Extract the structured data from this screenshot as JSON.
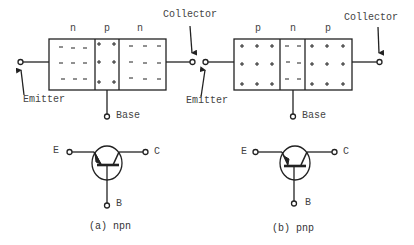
{
  "npn": {
    "regions": [
      "n",
      "p",
      "n"
    ],
    "region_charges": [
      "-",
      "+",
      "-"
    ],
    "terminals": {
      "emitter": "Emitter",
      "collector": "Collector",
      "base": "Base"
    },
    "symbol": {
      "e": "E",
      "c": "C",
      "b": "B"
    },
    "caption": "(a) npn"
  },
  "pnp": {
    "regions": [
      "p",
      "n",
      "p"
    ],
    "region_charges": [
      "+",
      "-",
      "+"
    ],
    "terminals": {
      "emitter": "Emitter",
      "collector": "Collector",
      "base": "Base"
    },
    "symbol": {
      "e": "E",
      "c": "C",
      "b": "B"
    },
    "caption": "(b) pnp"
  },
  "colors": {
    "line": "#222222",
    "text": "#444444",
    "background": "#ffffff"
  }
}
